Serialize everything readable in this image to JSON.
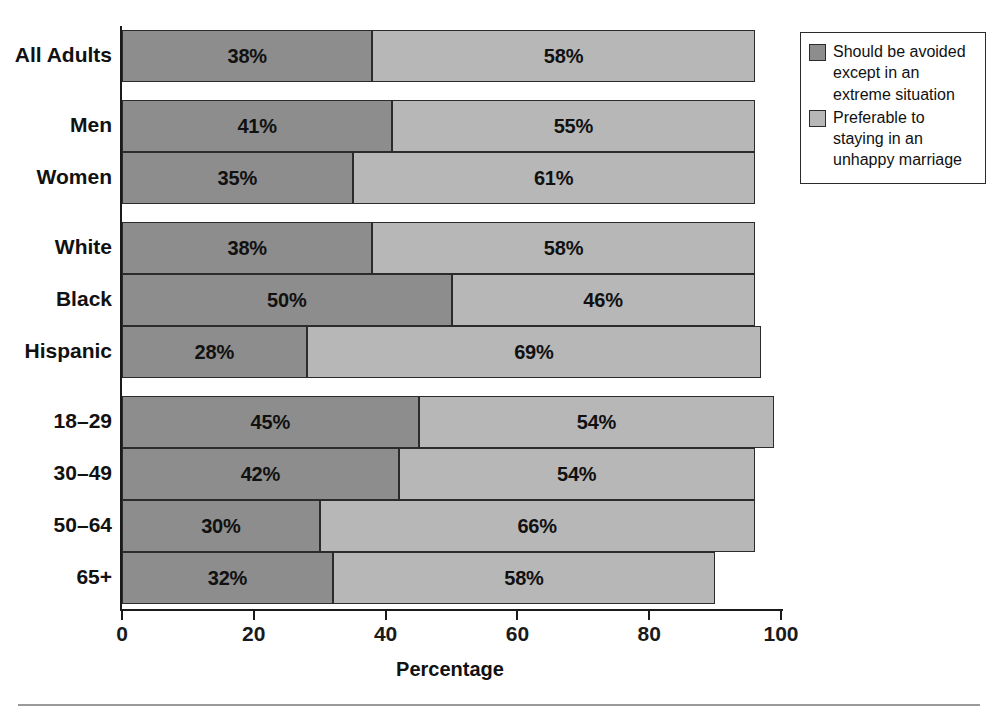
{
  "chart_data": {
    "type": "bar",
    "orientation": "horizontal",
    "stacked": true,
    "title": "",
    "xlabel": "Percentage",
    "ylabel": "",
    "xlim": [
      0,
      100
    ],
    "xticks": [
      0,
      20,
      40,
      60,
      80,
      100
    ],
    "grid": false,
    "legend_position": "top-right",
    "categories": [
      "All Adults",
      "Men",
      "Women",
      "White",
      "Black",
      "Hispanic",
      "18–29",
      "30–49",
      "50–64",
      "65+"
    ],
    "groups": [
      {
        "name": "total",
        "categories": [
          "All Adults"
        ]
      },
      {
        "name": "gender",
        "categories": [
          "Men",
          "Women"
        ]
      },
      {
        "name": "race",
        "categories": [
          "White",
          "Black",
          "Hispanic"
        ]
      },
      {
        "name": "age",
        "categories": [
          "18–29",
          "30–49",
          "50–64",
          "65+"
        ]
      }
    ],
    "series": [
      {
        "name": "Should be avoided except in an extreme situation",
        "color": "#8d8d8d",
        "values": [
          38,
          41,
          35,
          38,
          50,
          28,
          45,
          42,
          30,
          32
        ],
        "labels": [
          "38%",
          "41%",
          "35%",
          "38%",
          "50%",
          "28%",
          "45%",
          "42%",
          "30%",
          "32%"
        ]
      },
      {
        "name": "Preferable to staying in an unhappy marriage",
        "color": "#b7b7b7",
        "values": [
          58,
          55,
          61,
          58,
          46,
          69,
          54,
          54,
          66,
          58
        ],
        "labels": [
          "58%",
          "55%",
          "61%",
          "58%",
          "46%",
          "69%",
          "54%",
          "54%",
          "66%",
          "58%"
        ]
      }
    ]
  },
  "axis": {
    "x_title": "Percentage",
    "tick_labels": [
      "0",
      "20",
      "40",
      "60",
      "80",
      "100"
    ]
  },
  "legend": {
    "items": [
      {
        "swatch": "#8d8d8d",
        "label": "Should be avoided except in an extreme situation"
      },
      {
        "swatch": "#b7b7b7",
        "label": "Preferable to staying in an unhappy marriage"
      }
    ]
  }
}
